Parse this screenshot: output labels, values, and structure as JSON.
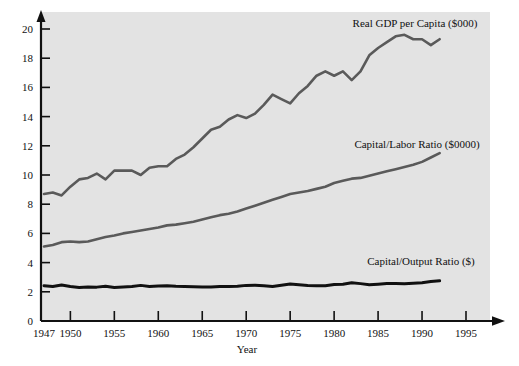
{
  "chart_data": {
    "type": "line",
    "title": "",
    "xlabel": "Year",
    "ylabel": "",
    "xlim": [
      1947,
      1995
    ],
    "ylim": [
      0,
      20
    ],
    "grid": false,
    "legend_position": "inline-annotations",
    "background_color": "#e3e3e3",
    "xticks": [
      1947,
      1950,
      1955,
      1960,
      1965,
      1970,
      1975,
      1980,
      1985,
      1990,
      1995
    ],
    "xtick_labels": [
      "1947",
      "1950",
      "1955",
      "1960",
      "1965",
      "1970",
      "1975",
      "1980",
      "1985",
      "1990",
      "1995"
    ],
    "yticks": [
      0,
      2,
      4,
      6,
      8,
      10,
      12,
      14,
      16,
      18,
      20
    ],
    "ytick_labels": [
      "0",
      "2",
      "4",
      "6",
      "8",
      "10",
      "12",
      "14",
      "16",
      "18",
      "20"
    ],
    "x": [
      1947,
      1948,
      1949,
      1950,
      1951,
      1952,
      1953,
      1954,
      1955,
      1956,
      1957,
      1958,
      1959,
      1960,
      1961,
      1962,
      1963,
      1964,
      1965,
      1966,
      1967,
      1968,
      1969,
      1970,
      1971,
      1972,
      1973,
      1974,
      1975,
      1976,
      1977,
      1978,
      1979,
      1980,
      1981,
      1982,
      1983,
      1984,
      1985,
      1986,
      1987,
      1988,
      1989,
      1990,
      1991,
      1992
    ],
    "series": [
      {
        "name": "Real GDP per Capita ($000)",
        "label": "Real GDP per Capita ($000)",
        "color": "#5a5a5a",
        "line_width": 2.6,
        "values": [
          8.7,
          8.8,
          8.6,
          9.2,
          9.7,
          9.8,
          10.1,
          9.7,
          10.3,
          10.3,
          10.3,
          10.0,
          10.5,
          10.6,
          10.6,
          11.1,
          11.4,
          11.9,
          12.5,
          13.1,
          13.3,
          13.8,
          14.1,
          13.9,
          14.2,
          14.8,
          15.5,
          15.2,
          14.9,
          15.6,
          16.1,
          16.8,
          17.1,
          16.8,
          17.1,
          16.5,
          17.1,
          18.2,
          18.7,
          19.1,
          19.5,
          19.6,
          19.3,
          19.3,
          18.9,
          19.3
        ]
      },
      {
        "name": "Capital/Labor Ratio ($0000)",
        "label": "Capital/Labor Ratio ($0000)",
        "color": "#5a5a5a",
        "line_width": 2.6,
        "values": [
          5.1,
          5.2,
          5.4,
          5.45,
          5.4,
          5.45,
          5.6,
          5.75,
          5.85,
          6.0,
          6.1,
          6.2,
          6.3,
          6.4,
          6.55,
          6.6,
          6.7,
          6.8,
          6.95,
          7.1,
          7.25,
          7.35,
          7.5,
          7.7,
          7.9,
          8.1,
          8.3,
          8.5,
          8.7,
          8.8,
          8.9,
          9.05,
          9.2,
          9.45,
          9.6,
          9.75,
          9.8,
          9.95,
          10.1,
          10.25,
          10.4,
          10.55,
          10.7,
          10.9,
          11.2,
          11.5
        ]
      },
      {
        "name": "Capital/Output Ratio ($)",
        "label": "Capital/Output Ratio ($)",
        "color": "#111111",
        "line_width": 3.0,
        "values": [
          2.42,
          2.36,
          2.46,
          2.36,
          2.3,
          2.33,
          2.32,
          2.38,
          2.3,
          2.33,
          2.36,
          2.44,
          2.37,
          2.4,
          2.42,
          2.38,
          2.36,
          2.35,
          2.33,
          2.33,
          2.37,
          2.36,
          2.38,
          2.44,
          2.45,
          2.41,
          2.37,
          2.45,
          2.53,
          2.48,
          2.44,
          2.42,
          2.42,
          2.5,
          2.52,
          2.62,
          2.56,
          2.49,
          2.52,
          2.56,
          2.56,
          2.55,
          2.58,
          2.62,
          2.7,
          2.75
        ]
      }
    ],
    "annotations": [
      {
        "text": "Real GDP per Capita ($000)",
        "x_px": 415,
        "y_px": 27,
        "anchor": "middle"
      },
      {
        "text": "Capital/Labor Ratio ($0000)",
        "x_px": 417,
        "y_px": 148,
        "anchor": "middle"
      },
      {
        "text": "Capital/Output Ratio ($)",
        "x_px": 421,
        "y_px": 265,
        "anchor": "middle"
      }
    ]
  },
  "axis": {
    "x_title": "Year"
  }
}
